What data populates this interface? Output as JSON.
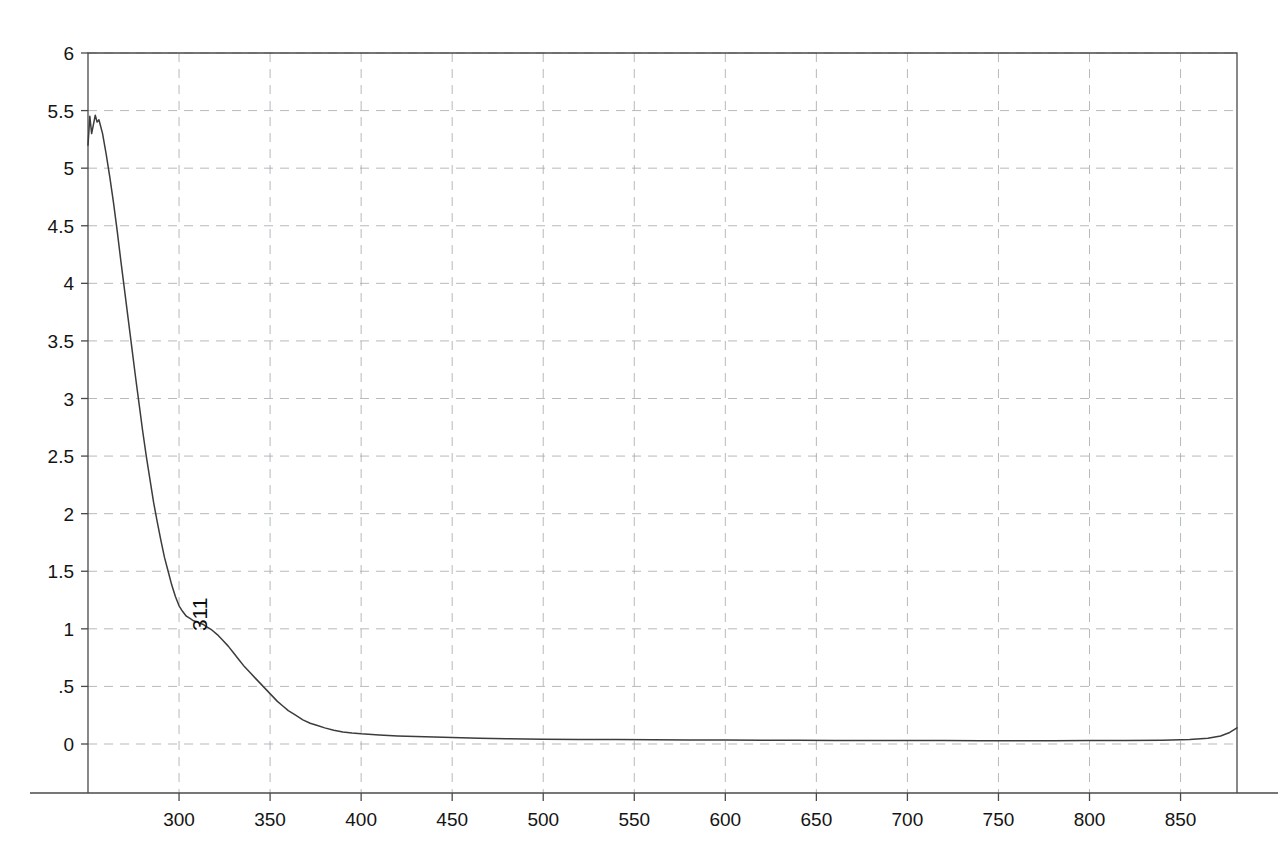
{
  "chart_data": {
    "type": "line",
    "title": "",
    "subtitle": "",
    "xlabel": "",
    "ylabel": "",
    "xlim": [
      250,
      881
    ],
    "ylim": [
      0,
      6
    ],
    "grid": true,
    "legend": null,
    "x_ticks": [
      300,
      350,
      400,
      450,
      500,
      550,
      600,
      650,
      700,
      750,
      800,
      850
    ],
    "x_tick_labels": [
      "300",
      "350",
      "400",
      "450",
      "500",
      "550",
      "600",
      "650",
      "700",
      "750",
      "800",
      "850"
    ],
    "y_ticks": [
      0,
      0.5,
      1,
      1.5,
      2,
      2.5,
      3,
      3.5,
      4,
      4.5,
      5,
      5.5,
      6
    ],
    "y_tick_labels": [
      "0",
      ".5",
      "1",
      "1.5",
      "2",
      "2.5",
      "3",
      "3.5",
      "4",
      "4.5",
      "5",
      "5.5",
      "6"
    ],
    "annotations": [
      {
        "label": "311",
        "x": 311,
        "y": 1.05,
        "rotation": -90
      }
    ],
    "series": [
      {
        "name": "absorbance",
        "color": "#3c3c3c",
        "x": [
          250,
          251,
          252,
          253,
          254,
          255,
          256,
          258,
          260,
          262,
          264,
          266,
          268,
          270,
          272,
          274,
          276,
          278,
          280,
          282,
          284,
          286,
          288,
          290,
          292,
          294,
          296,
          298,
          300,
          302,
          304,
          306,
          308,
          310,
          311,
          313,
          315,
          318,
          321,
          324,
          327,
          330,
          333,
          336,
          339,
          342,
          345,
          348,
          351,
          354,
          357,
          360,
          364,
          368,
          372,
          376,
          380,
          385,
          390,
          395,
          400,
          410,
          420,
          430,
          440,
          450,
          465,
          480,
          500,
          520,
          540,
          560,
          580,
          600,
          620,
          640,
          660,
          680,
          700,
          720,
          740,
          760,
          780,
          800,
          820,
          840,
          855,
          865,
          872,
          877,
          881
        ],
        "y": [
          5.2,
          5.45,
          5.3,
          5.38,
          5.46,
          5.4,
          5.42,
          5.3,
          5.12,
          4.92,
          4.7,
          4.46,
          4.2,
          3.95,
          3.7,
          3.45,
          3.2,
          2.96,
          2.72,
          2.5,
          2.3,
          2.1,
          1.93,
          1.77,
          1.62,
          1.5,
          1.38,
          1.28,
          1.2,
          1.15,
          1.11,
          1.09,
          1.07,
          1.06,
          1.05,
          1.04,
          1.02,
          0.99,
          0.95,
          0.9,
          0.85,
          0.79,
          0.73,
          0.67,
          0.62,
          0.57,
          0.52,
          0.47,
          0.42,
          0.37,
          0.33,
          0.29,
          0.25,
          0.21,
          0.18,
          0.16,
          0.14,
          0.12,
          0.105,
          0.095,
          0.088,
          0.078,
          0.07,
          0.065,
          0.06,
          0.056,
          0.05,
          0.046,
          0.042,
          0.04,
          0.038,
          0.036,
          0.035,
          0.034,
          0.033,
          0.032,
          0.031,
          0.031,
          0.03,
          0.03,
          0.029,
          0.029,
          0.029,
          0.03,
          0.031,
          0.033,
          0.038,
          0.05,
          0.07,
          0.1,
          0.14
        ]
      }
    ]
  }
}
